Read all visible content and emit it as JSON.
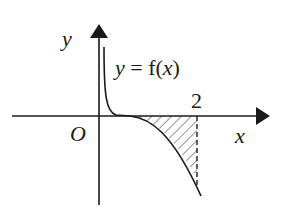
{
  "diagram": {
    "type": "function-graph",
    "axes": {
      "x_label": "x",
      "y_label": "y",
      "origin_label": "O"
    },
    "curve_label": {
      "prefix": "y = f(",
      "var": "x",
      "suffix": ")"
    },
    "tick_labels": [
      "2"
    ],
    "shaded_region": {
      "description": "hatched area between curve and x-axis from inflection to x = 2",
      "right_bound": "2",
      "boundary_style": "dashed"
    },
    "colors": {
      "stroke": "#1a1a1a",
      "background": "#ffffff"
    }
  }
}
